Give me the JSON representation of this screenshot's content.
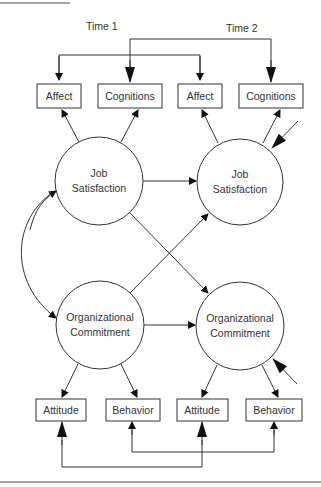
{
  "time_labels": {
    "t1": "Time 1",
    "t2": "Time 2"
  },
  "indicators_top": [
    {
      "label": "Affect"
    },
    {
      "label": "Cognitions"
    },
    {
      "label": "Affect"
    },
    {
      "label": "Cognitions"
    }
  ],
  "constructs": [
    {
      "line1": "Job",
      "line2": "Satisfaction"
    },
    {
      "line1": "Job",
      "line2": "Satisfaction"
    },
    {
      "line1": "Organizational",
      "line2": "Commitment"
    },
    {
      "line1": "Organizational",
      "line2": "Commitment"
    }
  ],
  "indicators_bottom": [
    {
      "label": "Attitude"
    },
    {
      "label": "Behavior"
    },
    {
      "label": "Attitude"
    },
    {
      "label": "Behavior"
    }
  ],
  "colors": {
    "stroke": "#333333",
    "rule": "#888888",
    "background": "#ffffff"
  }
}
